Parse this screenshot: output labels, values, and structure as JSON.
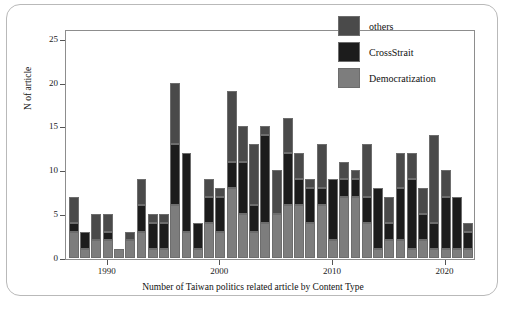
{
  "chart_data": {
    "type": "bar",
    "stacked": true,
    "title": "",
    "xlabel": "Number of Taiwan politics related article by Content Type",
    "ylabel": "N of article",
    "ylim": [
      0,
      26
    ],
    "yticks": [
      0,
      5,
      10,
      15,
      20,
      25
    ],
    "xticks": [
      1990,
      2000,
      2010,
      2020
    ],
    "xlim": [
      1986.3,
      2022.7
    ],
    "grid": false,
    "legend_position": "top-right",
    "colors": {
      "others": "#4a4a4a",
      "CrossStrait": "#1c1c1c",
      "Democratization": "#7d7d7d",
      "frame": "#b9b9b9",
      "axis": "#8d8d8d"
    },
    "categories": [
      1987,
      1988,
      1989,
      1990,
      1991,
      1992,
      1993,
      1994,
      1995,
      1996,
      1997,
      1998,
      1999,
      2000,
      2001,
      2002,
      2003,
      2004,
      2005,
      2006,
      2007,
      2008,
      2009,
      2010,
      2011,
      2012,
      2013,
      2014,
      2015,
      2016,
      2017,
      2018,
      2019,
      2020,
      2021,
      2022
    ],
    "series": [
      {
        "name": "Democratization",
        "values": [
          3,
          1,
          2,
          2,
          1,
          2,
          3,
          1,
          1,
          6,
          3,
          1,
          4,
          3,
          8,
          5,
          3,
          4,
          5,
          6,
          6,
          4,
          6,
          2,
          7,
          7,
          4,
          1,
          2,
          2,
          1,
          2,
          1,
          1,
          1,
          1
        ]
      },
      {
        "name": "CrossStrait",
        "values": [
          1,
          2,
          0,
          1,
          0,
          0,
          3,
          3,
          3,
          7,
          9,
          3,
          3,
          4,
          3,
          6,
          3,
          10,
          0,
          6,
          3,
          4,
          2,
          7,
          2,
          2,
          3,
          7,
          2,
          6,
          8,
          3,
          3,
          6,
          6,
          2
        ]
      },
      {
        "name": "others",
        "values": [
          3,
          0,
          3,
          2,
          0,
          1,
          3,
          1,
          1,
          7,
          0,
          0,
          2,
          1,
          8,
          4,
          7,
          1,
          5,
          4,
          3,
          1,
          5,
          0,
          2,
          1,
          6,
          0,
          3,
          4,
          3,
          3,
          10,
          3,
          0,
          1
        ]
      }
    ],
    "totals": [
      7,
      3,
      5,
      5,
      1,
      3,
      9,
      5,
      5,
      20,
      12,
      4,
      9,
      8,
      19,
      15,
      13,
      15,
      10,
      16,
      12,
      9,
      13,
      9,
      11,
      10,
      13,
      8,
      7,
      12,
      12,
      8,
      14,
      10,
      7,
      4
    ]
  },
  "legend": {
    "items": [
      {
        "label": "others",
        "color": "#4a4a4a"
      },
      {
        "label": "CrossStrait",
        "color": "#1c1c1c"
      },
      {
        "label": "Democratization",
        "color": "#7d7d7d"
      }
    ]
  }
}
